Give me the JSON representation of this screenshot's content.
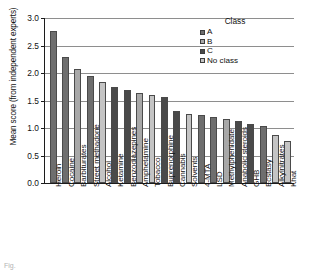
{
  "chart_data": {
    "type": "bar",
    "title": "",
    "xlabel": "",
    "ylabel": "Mean score (from independent experts)",
    "ylim": [
      0.0,
      3.0
    ],
    "ytick_labels": [
      "0.0",
      "0.5",
      "1.0",
      "1.5",
      "2.0",
      "2.5",
      "3.0"
    ],
    "ytick_values": [
      0.0,
      0.5,
      1.0,
      1.5,
      2.0,
      2.5,
      3.0
    ],
    "grid": "horizontal",
    "legend_position": "top-right",
    "categories": [
      "Heroin",
      "Cocaine",
      "Barbiturates",
      "Street methadone",
      "Alcohol",
      "Ketamine",
      "Benzodiazepines",
      "Amphetamine",
      "Tobacco",
      "Buprenorphine",
      "Cannabis",
      "Solvents",
      "4-MTA",
      "LSD",
      "Methylphenidate",
      "Anabolic steroids",
      "GHB",
      "Ecstasy",
      "Alkylnitrates",
      "Khat"
    ],
    "values": [
      2.77,
      2.29,
      2.08,
      1.94,
      1.83,
      1.75,
      1.69,
      1.64,
      1.6,
      1.56,
      1.31,
      1.25,
      1.24,
      1.2,
      1.16,
      1.13,
      1.08,
      1.04,
      0.88,
      0.76
    ],
    "point_classes": [
      "A",
      "A",
      "B",
      "A",
      "No class",
      "C",
      "C",
      "B",
      "No class",
      "C",
      "C",
      "No class",
      "A",
      "A",
      "B",
      "C",
      "C",
      "A",
      "No class",
      "No class"
    ],
    "series": [
      {
        "name": "Mean score (from independent experts)",
        "values": [
          2.77,
          2.29,
          2.08,
          1.94,
          1.83,
          1.75,
          1.69,
          1.64,
          1.6,
          1.56,
          1.31,
          1.25,
          1.24,
          1.2,
          1.16,
          1.13,
          1.08,
          1.04,
          0.88,
          0.76
        ]
      }
    ]
  },
  "legend": {
    "title": "Class",
    "entries": [
      {
        "label": "A",
        "color": "#6e6e6e"
      },
      {
        "label": "B",
        "color": "#a8a8a8"
      },
      {
        "label": "C",
        "color": "#4a4a4a"
      },
      {
        "label": "No class",
        "color": "#c4c4c4"
      }
    ]
  },
  "class_colors": {
    "A": "#6e6e6e",
    "B": "#a8a8a8",
    "C": "#4a4a4a",
    "No class": "#c4c4c4"
  },
  "caption": "Fig."
}
